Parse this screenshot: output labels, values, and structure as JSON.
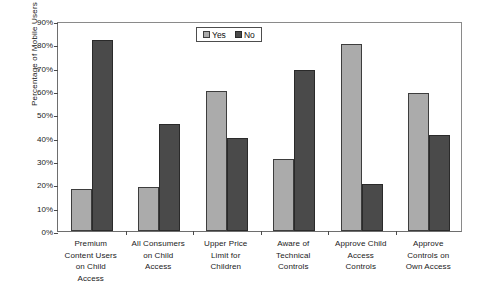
{
  "chart_data": {
    "type": "bar",
    "title": "",
    "subtitle": "",
    "xlabel": "",
    "ylabel": "Percentage of Mobile Users",
    "ylim": [
      0,
      90
    ],
    "ytick_labels": [
      "90%",
      "80%",
      "70%",
      "60%",
      "50%",
      "40%",
      "30%",
      "20%",
      "10%",
      "0%"
    ],
    "ytick_values": [
      90,
      80,
      70,
      60,
      50,
      40,
      30,
      20,
      10,
      0
    ],
    "grid": false,
    "legend_position": "top-center",
    "categories": [
      "Premium Content Users on Child Access",
      "All Consumers on Child Access",
      "Upper Price Limit for Children",
      "Aware of Technical Controls",
      "Approve Child Access Controls",
      "Approve Controls on Own Access"
    ],
    "category_lines": [
      [
        "Premium",
        "Content Users",
        "on Child",
        "Access"
      ],
      [
        "All Consumers",
        "on Child",
        "Access"
      ],
      [
        "Upper Price",
        "Limit for",
        "Children"
      ],
      [
        "Aware of",
        "Technical",
        "Controls"
      ],
      [
        "Approve Child",
        "Access",
        "Controls"
      ],
      [
        "Approve",
        "Controls on",
        "Own Access"
      ]
    ],
    "series": [
      {
        "name": "Yes",
        "color": "#ababab",
        "values": [
          18,
          19,
          60,
          31,
          80,
          59
        ]
      },
      {
        "name": "No",
        "color": "#4a4a4a",
        "values": [
          82,
          46,
          40,
          69,
          20,
          41
        ]
      }
    ]
  },
  "legend": {
    "entries": [
      {
        "label": "Yes",
        "swatch": "legend-swatch-yes"
      },
      {
        "label": "No",
        "swatch": "legend-swatch-no"
      }
    ]
  },
  "colors": {
    "yes": "#ababab",
    "no": "#4a4a4a",
    "axis": "#4b4b4b",
    "background": "#ffffff"
  }
}
